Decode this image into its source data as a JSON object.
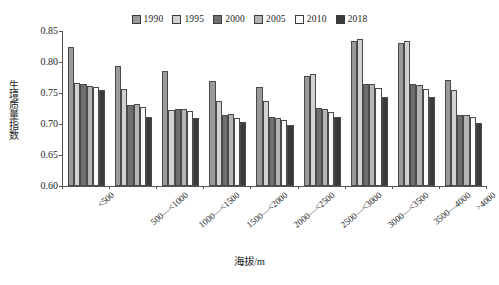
{
  "chart_data": {
    "type": "bar",
    "title": "",
    "xlabel": "海拔/m",
    "ylabel": "生境质量指数",
    "ylim": [
      0.6,
      0.85
    ],
    "yticks": [
      "0.60",
      "0.65",
      "0.70",
      "0.75",
      "0.80",
      "0.85"
    ],
    "ytick_values": [
      0.6,
      0.65,
      0.7,
      0.75,
      0.8,
      0.85
    ],
    "grid": false,
    "legend_position": "top-center",
    "categories": [
      "<500",
      "500—<1000",
      "1000—<1500",
      "1500—<2000",
      "2000—<2500",
      "2500—<3000",
      "3000—<3500",
      "3500—4000",
      ">4000"
    ],
    "series": [
      {
        "name": "1990",
        "color": "#9a9a9a",
        "values": [
          0.825,
          0.793,
          0.785,
          0.77,
          0.76,
          0.777,
          0.834,
          0.83,
          0.771
        ]
      },
      {
        "name": "1995",
        "color": "#d2d2d2",
        "values": [
          0.766,
          0.757,
          0.722,
          0.737,
          0.737,
          0.781,
          0.837,
          0.834,
          0.755
        ]
      },
      {
        "name": "2000",
        "color": "#6f6f6f",
        "values": [
          0.765,
          0.731,
          0.724,
          0.714,
          0.711,
          0.726,
          0.765,
          0.764,
          0.714
        ]
      },
      {
        "name": "2005",
        "color": "#b4b4b4",
        "values": [
          0.762,
          0.732,
          0.724,
          0.716,
          0.71,
          0.724,
          0.764,
          0.763,
          0.715
        ]
      },
      {
        "name": "2010",
        "color": "#fbfbfb",
        "values": [
          0.76,
          0.727,
          0.721,
          0.709,
          0.706,
          0.719,
          0.758,
          0.756,
          0.712
        ]
      },
      {
        "name": "2018",
        "color": "#3a3a3a",
        "values": [
          0.755,
          0.712,
          0.71,
          0.704,
          0.699,
          0.712,
          0.744,
          0.743,
          0.701
        ]
      }
    ]
  }
}
